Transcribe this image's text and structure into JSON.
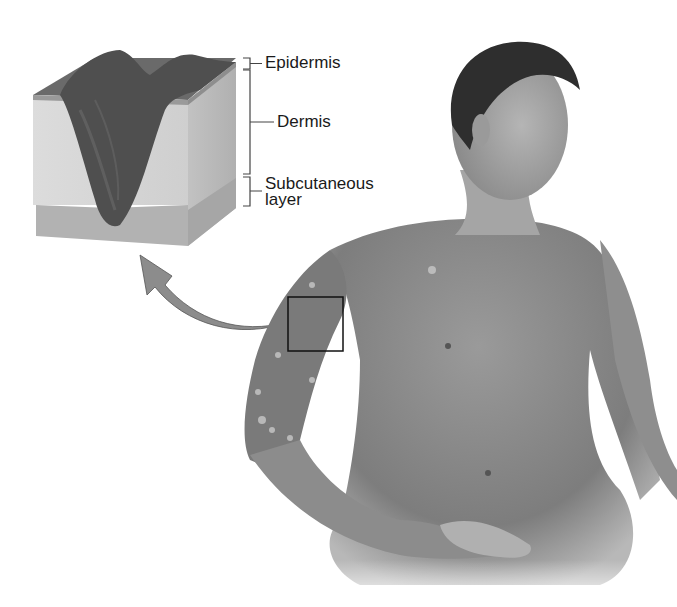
{
  "figure": {
    "inset": "Skin cross-section block showing deep ulcer"
  },
  "labels": {
    "epidermis": "Epidermis",
    "dermis": "Dermis",
    "subcutaneous_line1": "Subcutaneous",
    "subcutaneous_line2": "layer"
  },
  "colors": {
    "ulcer": "#4a4a4a",
    "dermis": "#d6d6d6",
    "subcutaneous": "#b4b4b4",
    "skin": "#8a8a8a",
    "arrow": "#8c8c8c",
    "outline": "#222222"
  }
}
